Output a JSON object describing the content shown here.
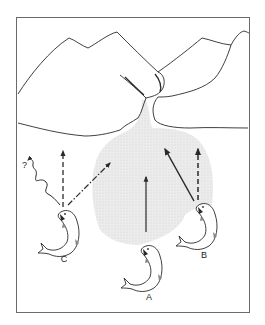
{
  "figure": {
    "colors": {
      "background": "#ffffff",
      "ink": "#2a2a2a",
      "plume": "#e6e6e6",
      "frame": "#6a6a6a"
    },
    "labels": {
      "fish_a": "A",
      "fish_b": "B",
      "fish_c": "C",
      "question": "?"
    },
    "fish": [
      {
        "id": "A",
        "position": "bottom-center",
        "paths": [
          "solid arrow straight up"
        ]
      },
      {
        "id": "B",
        "position": "right",
        "paths": [
          "solid arrow up-left toward stream",
          "dashed arrow straight up"
        ]
      },
      {
        "id": "C",
        "position": "left",
        "paths": [
          "dashed arrow straight up",
          "dash-dot arrow up-right",
          "wavy line ending in ?"
        ]
      }
    ]
  }
}
